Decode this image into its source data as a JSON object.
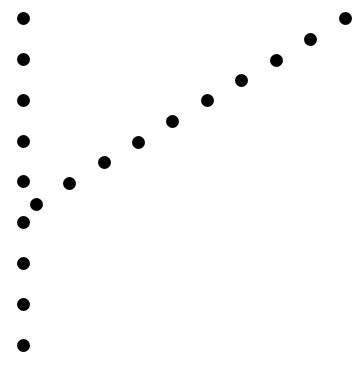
{
  "figure": {
    "background": "#ffffff",
    "dot_color": "#000000",
    "dot_diameter": 13,
    "groups": [
      {
        "name": "vertical-column",
        "dots": [
          {
            "x": 23,
            "y": 18
          },
          {
            "x": 23,
            "y": 59
          },
          {
            "x": 23,
            "y": 100
          },
          {
            "x": 23,
            "y": 141
          },
          {
            "x": 23,
            "y": 181
          },
          {
            "x": 23,
            "y": 222
          },
          {
            "x": 23,
            "y": 263
          },
          {
            "x": 23,
            "y": 304
          },
          {
            "x": 23,
            "y": 345
          }
        ]
      },
      {
        "name": "diagonal-line",
        "dots": [
          {
            "x": 36,
            "y": 204
          },
          {
            "x": 69,
            "y": 183
          },
          {
            "x": 104,
            "y": 162
          },
          {
            "x": 138,
            "y": 142
          },
          {
            "x": 172,
            "y": 121
          },
          {
            "x": 207,
            "y": 100
          },
          {
            "x": 241,
            "y": 80
          },
          {
            "x": 276,
            "y": 60
          },
          {
            "x": 310,
            "y": 39
          },
          {
            "x": 345,
            "y": 18
          }
        ]
      }
    ]
  }
}
